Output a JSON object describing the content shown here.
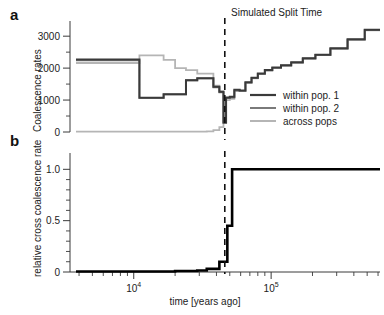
{
  "figure": {
    "panel_a_label": "a",
    "panel_b_label": "b",
    "annotation": "Simulated Split Time",
    "x_axis_title": "time [years ago]",
    "panel_a_y_title": "Coalescence rates",
    "panel_b_y_title": "relative cross coalescence rate"
  },
  "colors": {
    "within_pop_1": "#3a3a3a",
    "within_pop_2": "#7a7a7a",
    "across_pops": "#b5b5b5",
    "axis": "#3a3a3a",
    "text": "#222222",
    "split_line": "#111111",
    "panel_b_curve": "#000000",
    "background": "#ffffff"
  },
  "legend": {
    "position": "inside-right",
    "entries": [
      {
        "label": "within pop. 1",
        "color_key": "within_pop_1"
      },
      {
        "label": "within pop. 2",
        "color_key": "within_pop_2"
      },
      {
        "label": "across pops",
        "color_key": "across_pops"
      }
    ]
  },
  "axis_ticks": {
    "x_major": [
      {
        "value": 10000,
        "label_mantissa": "10",
        "label_exponent": "4"
      },
      {
        "value": 100000,
        "label_mantissa": "10",
        "label_exponent": "5"
      }
    ],
    "x_minor": [
      4000,
      5000,
      6000,
      7000,
      8000,
      9000,
      20000,
      30000,
      40000,
      50000,
      60000,
      70000,
      80000,
      90000,
      200000,
      300000,
      400000,
      500000,
      600000
    ],
    "x_range": [
      3800,
      620000
    ],
    "panel_a_y_major": [
      0,
      1000,
      2000,
      3000
    ],
    "panel_a_y_minor": [
      500,
      1500,
      2500
    ],
    "panel_a_ylim": [
      0,
      3350
    ],
    "panel_b_y_major": [
      {
        "value": 0,
        "label": "0"
      },
      {
        "value": 0.5,
        "label": "0.5"
      },
      {
        "value": 1.0,
        "label": "1.0"
      }
    ],
    "panel_b_y_minor": [
      0.1,
      0.2,
      0.3,
      0.4,
      0.6,
      0.7,
      0.8,
      0.9
    ],
    "panel_b_ylim": [
      0,
      1.12
    ]
  },
  "chart_data": [
    {
      "type": "line",
      "id": "panel_a",
      "title": "",
      "xlabel": "time [years ago]",
      "ylabel": "Coalescence rates",
      "xscale": "log",
      "xlim": [
        3800,
        620000
      ],
      "ylim": [
        0,
        3350
      ],
      "grid": false,
      "step": "post",
      "annotations": [
        {
          "text": "Simulated Split Time",
          "x": 46000,
          "type": "vline-dashed"
        }
      ],
      "series": [
        {
          "name": "within pop. 1",
          "color_key": "within_pop_1",
          "x": [
            3800,
            9000,
            11000,
            13500,
            16500,
            20000,
            24000,
            29000,
            34000,
            38000,
            42000,
            45000,
            47000,
            50000,
            54000,
            59000,
            65000,
            72000,
            80000,
            90000,
            102000,
            118000,
            140000,
            170000,
            210000,
            270000,
            360000,
            480000,
            620000
          ],
          "y": [
            2270,
            2270,
            1070,
            1070,
            1180,
            1180,
            1620,
            1680,
            1680,
            1420,
            1260,
            300,
            1080,
            1100,
            1320,
            1300,
            1560,
            1700,
            1830,
            1940,
            2020,
            2090,
            2180,
            2310,
            2420,
            2620,
            2900,
            3200,
            3200
          ]
        },
        {
          "name": "within pop. 2",
          "color_key": "within_pop_2",
          "x": [
            3800,
            9000,
            11000,
            13500,
            16500,
            20000,
            24000,
            29000,
            34000,
            38000,
            42000,
            45000,
            47000,
            50000,
            54000,
            59000,
            65000,
            72000,
            80000,
            90000,
            102000,
            118000,
            140000,
            170000,
            210000,
            270000,
            360000,
            480000,
            620000
          ],
          "y": [
            2240,
            2240,
            1070,
            1070,
            1180,
            1180,
            1620,
            1680,
            1680,
            1400,
            1240,
            290,
            1060,
            1080,
            1300,
            1290,
            1545,
            1690,
            1820,
            1930,
            2010,
            2080,
            2170,
            2300,
            2415,
            2610,
            2890,
            3190,
            3190
          ]
        },
        {
          "name": "across pops",
          "color_key": "across_pops",
          "x": [
            3800,
            9000,
            11000,
            13500,
            16500,
            20000,
            24000,
            29000,
            34000,
            38000,
            42000,
            45000,
            47000,
            50000,
            54000,
            59000,
            65000,
            72000,
            80000,
            90000,
            102000,
            118000,
            140000,
            170000,
            210000,
            270000,
            360000,
            480000,
            620000
          ],
          "y": [
            2160,
            2160,
            2400,
            2400,
            2260,
            2000,
            1940,
            1830,
            1830,
            1450,
            1270,
            640,
            1000,
            1040,
            1290,
            1280,
            1540,
            1680,
            1815,
            1925,
            2005,
            2075,
            2165,
            2295,
            2410,
            2605,
            2885,
            3185,
            3185
          ]
        },
        {
          "name": "across pops baseline",
          "color_key": "across_pops",
          "x": [
            3800,
            9000,
            13500,
            20000,
            29000,
            34000,
            38000,
            42000,
            45000
          ],
          "y": [
            10,
            10,
            10,
            10,
            10,
            20,
            60,
            150,
            640
          ]
        }
      ]
    },
    {
      "type": "line",
      "id": "panel_b",
      "title": "",
      "xlabel": "time [years ago]",
      "ylabel": "relative cross coalescence rate",
      "xscale": "log",
      "xlim": [
        3800,
        620000
      ],
      "ylim": [
        0,
        1.12
      ],
      "grid": false,
      "step": "post",
      "annotations": [
        {
          "text": "Simulated Split Time",
          "x": 46000,
          "type": "vline-dashed"
        }
      ],
      "series": [
        {
          "name": "relative cross coalescence rate",
          "color_key": "panel_b_curve",
          "x": [
            3800,
            9000,
            13500,
            20000,
            29000,
            34000,
            38000,
            42000,
            45000,
            48000,
            52000,
            620000
          ],
          "y": [
            0.005,
            0.005,
            0.005,
            0.01,
            0.015,
            0.03,
            0.03,
            0.1,
            0.1,
            0.45,
            1.0,
            1.0
          ]
        }
      ]
    }
  ]
}
